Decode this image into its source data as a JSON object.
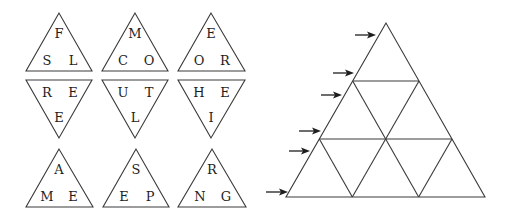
{
  "colors": {
    "stroke": "#3a3a3a",
    "text": "#1e1e1e",
    "background": "#ffffff"
  },
  "tiles": [
    {
      "id": "t1",
      "orientation": "up",
      "apex": [
        59,
        13
      ],
      "base": [
        [
          26,
          71
        ],
        [
          92,
          71
        ]
      ],
      "letters": {
        "top": "F",
        "left": "S",
        "right": "L"
      }
    },
    {
      "id": "t2",
      "orientation": "up",
      "apex": [
        135,
        13
      ],
      "base": [
        [
          102,
          71
        ],
        [
          168,
          71
        ]
      ],
      "letters": {
        "top": "M",
        "left": "C",
        "right": "O"
      }
    },
    {
      "id": "t3",
      "orientation": "up",
      "apex": [
        211,
        13
      ],
      "base": [
        [
          178,
          71
        ],
        [
          245,
          71
        ]
      ],
      "letters": {
        "top": "E",
        "left": "O",
        "right": "R"
      }
    },
    {
      "id": "t4",
      "orientation": "down",
      "apex": [
        59,
        138
      ],
      "base": [
        [
          26,
          80
        ],
        [
          92,
          80
        ]
      ],
      "letters": {
        "left": "R",
        "right": "E",
        "bottom": "E"
      }
    },
    {
      "id": "t5",
      "orientation": "down",
      "apex": [
        135,
        138
      ],
      "base": [
        [
          102,
          80
        ],
        [
          168,
          80
        ]
      ],
      "letters": {
        "left": "U",
        "right": "T",
        "bottom": "L"
      }
    },
    {
      "id": "t6",
      "orientation": "down",
      "apex": [
        211,
        138
      ],
      "base": [
        [
          178,
          80
        ],
        [
          245,
          80
        ]
      ],
      "letters": {
        "left": "H",
        "right": "E",
        "bottom": "I"
      }
    },
    {
      "id": "t7",
      "orientation": "up",
      "apex": [
        59,
        149
      ],
      "base": [
        [
          26,
          207
        ],
        [
          93,
          207
        ]
      ],
      "letters": {
        "top": "A",
        "left": "M",
        "right": "E"
      }
    },
    {
      "id": "t8",
      "orientation": "up",
      "apex": [
        136,
        149
      ],
      "base": [
        [
          103,
          207
        ],
        [
          169,
          207
        ]
      ],
      "letters": {
        "top": "S",
        "left": "E",
        "right": "P"
      }
    },
    {
      "id": "t9",
      "orientation": "up",
      "apex": [
        212,
        149
      ],
      "base": [
        [
          178,
          207
        ],
        [
          246,
          207
        ]
      ],
      "letters": {
        "top": "R",
        "left": "N",
        "right": "G"
      }
    }
  ],
  "puzzle_grid": {
    "outer": {
      "apex": [
        386,
        23
      ],
      "base_left": [
        286,
        197
      ],
      "base_right": [
        485,
        197
      ]
    },
    "rows": 3,
    "small_triangle_count": 9
  },
  "arrows": [
    {
      "from": [
        355,
        35
      ],
      "to": [
        376,
        35
      ]
    },
    {
      "from": [
        333,
        73
      ],
      "to": [
        354,
        73
      ]
    },
    {
      "from": [
        321,
        95
      ],
      "to": [
        342,
        95
      ]
    },
    {
      "from": [
        299,
        131
      ],
      "to": [
        321,
        131
      ]
    },
    {
      "from": [
        289,
        151
      ],
      "to": [
        310,
        151
      ]
    },
    {
      "from": [
        266,
        192
      ],
      "to": [
        288,
        192
      ]
    }
  ]
}
